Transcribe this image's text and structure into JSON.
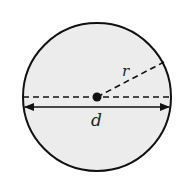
{
  "diagram": {
    "colors": {
      "fill": "#ececec",
      "stroke": "#111111",
      "background": "#ffffff"
    },
    "circle": {
      "cx": 97,
      "cy": 97,
      "r": 74
    },
    "center_point": {
      "cx": 97,
      "cy": 97,
      "r": 4.5
    },
    "labels": {
      "radius": "r",
      "diameter": "d"
    }
  }
}
